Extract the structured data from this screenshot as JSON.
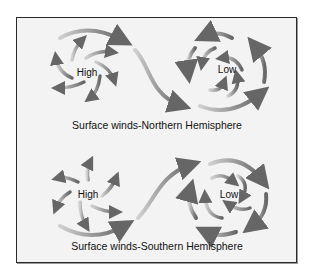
{
  "diagram": {
    "panels": [
      {
        "id": "northern",
        "caption": "Surface winds-Northern Hemisphere",
        "high": {
          "label": "High",
          "rotation": "clockwise",
          "flow": "outward"
        },
        "low": {
          "label": "Low",
          "rotation": "counterclockwise",
          "flow": "inward"
        },
        "connector": "High to Low curved arrow"
      },
      {
        "id": "southern",
        "caption": "Surface winds-Southern Hemisphere",
        "high": {
          "label": "High",
          "rotation": "counterclockwise",
          "flow": "outward"
        },
        "low": {
          "label": "Low",
          "rotation": "clockwise",
          "flow": "inward"
        },
        "connector": "High to Low curved arrow"
      }
    ],
    "colors": {
      "background": "#f3f3f3",
      "frame": "#2a2a2a",
      "arrow_dark": "#6a6a6a",
      "arrow_light": "#c8c8c8"
    }
  }
}
